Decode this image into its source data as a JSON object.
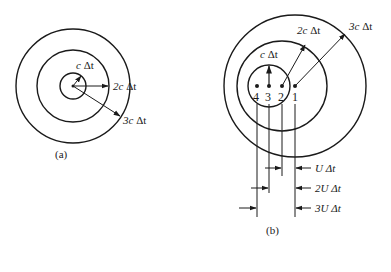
{
  "figure_a": {
    "caption": "(a)",
    "center": [
      73,
      86
    ],
    "radii": [
      13,
      36,
      57
    ],
    "labels": {
      "r1_coef": "c",
      "r1_unit": " Δt",
      "r2_coef": "2c",
      "r2_unit": " Δt",
      "r3_coef": "3c",
      "r3_unit": " Δt"
    }
  },
  "figure_b": {
    "caption": "(b)",
    "points": [
      {
        "id": "1",
        "x": 295
      },
      {
        "id": "2",
        "x": 282
      },
      {
        "id": "3",
        "x": 269
      },
      {
        "id": "4",
        "x": 257
      }
    ],
    "labels": {
      "r1_coef": "c",
      "r1_unit": " Δt",
      "r2_coef": "2c",
      "r2_unit": " Δt",
      "r3_coef": "3c",
      "r3_unit": " Δt",
      "d1": "U Δt",
      "d2": "2U Δt",
      "d3": "3U Δt"
    }
  },
  "colors": {
    "ink": "#1a1a1a",
    "background": "#ffffff"
  }
}
